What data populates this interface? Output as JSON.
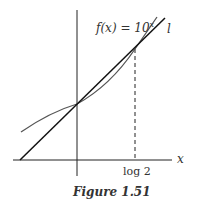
{
  "figure": {
    "caption": "Figure 1.51",
    "function_label": "f(x) = 10",
    "function_exponent": "x",
    "line_label": "l",
    "x_axis_label": "x",
    "tick_label": "log 2"
  },
  "colors": {
    "curve": "#555555",
    "line": "#111111",
    "axes": "#222222"
  }
}
